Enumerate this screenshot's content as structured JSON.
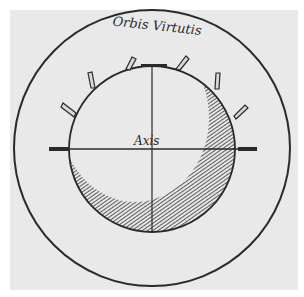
{
  "diagram": {
    "title_label": "Orbis Virtutis",
    "axis_label": "Axis",
    "colors": {
      "paper": "#e9e9e9",
      "ink": "#2a2a2a",
      "background": "#ffffff"
    },
    "elements": {
      "outer_circle": {
        "cx": 152,
        "cy": 148,
        "r": 138
      },
      "inner_sphere": {
        "cx": 152,
        "cy": 149,
        "r": 83
      },
      "horizontal_axis": {
        "x1": 49,
        "x2": 257,
        "y": 149
      },
      "vertical_axis": {
        "x": 152,
        "y1": 66,
        "y2": 232
      }
    }
  }
}
